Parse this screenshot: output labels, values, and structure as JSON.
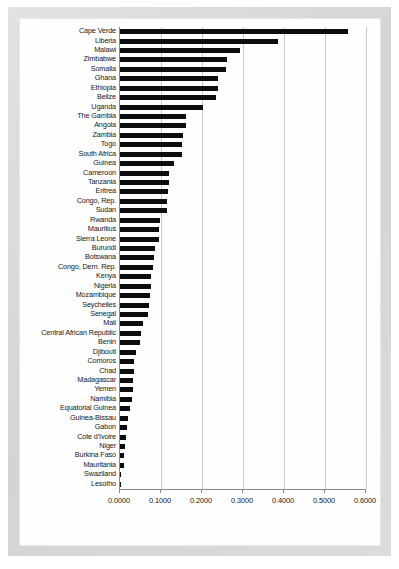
{
  "chart_data": {
    "type": "bar",
    "orientation": "horizontal",
    "title": "",
    "subtitle": "",
    "xlabel": "",
    "ylabel": "",
    "xlim": [
      0.0,
      0.6
    ],
    "ylim": null,
    "grid": true,
    "legend": null,
    "legend_position": "none",
    "bar_color": "#0d0d0d",
    "gridline_color": "#c9c9c9",
    "axis_color": "#8a8a8a",
    "xticks": [
      0.0,
      0.1,
      0.2,
      0.3,
      0.4,
      0.5,
      0.6
    ],
    "xtick_labels": [
      "0.0000",
      "0.1000",
      "0.2000",
      "0.3000",
      "0.4000",
      "0.5000",
      "0.6000"
    ],
    "categories": [
      "Cape Verde",
      "Liberia",
      "Malawi",
      "Zimbabwe",
      "Somalia",
      "Ghana",
      "Ethiopia",
      "Belize",
      "Uganda",
      "The Gambia",
      "Angola",
      "Zambia",
      "Togo",
      "South Africa",
      "Guinea",
      "Cameroon",
      "Tanzania",
      "Eritrea",
      "Congo, Rep.",
      "Sudan",
      "Rwanda",
      "Mauritius",
      "Sierra Leone",
      "Burundi",
      "Botswana",
      "Congo, Dem. Rep.",
      "Kenya",
      "Nigeria",
      "Mozambique",
      "Seychelles",
      "Senegal",
      "Mali",
      "Central African Republic",
      "Benin",
      "Djibouti",
      "Comoros",
      "Chad",
      "Madagascar",
      "Yemen",
      "Namibia",
      "Equatorial Guinea",
      "Guinea-Bissau",
      "Gabon",
      "Cote d'Ivoire",
      "Niger",
      "Burkina Faso",
      "Mauritania",
      "Swaziland",
      "Lesotho"
    ],
    "values": [
      0.557,
      0.385,
      0.293,
      0.262,
      0.258,
      0.24,
      0.238,
      0.235,
      0.202,
      0.162,
      0.16,
      0.154,
      0.151,
      0.15,
      0.132,
      0.12,
      0.119,
      0.118,
      0.115,
      0.114,
      0.098,
      0.096,
      0.095,
      0.085,
      0.084,
      0.081,
      0.076,
      0.075,
      0.074,
      0.07,
      0.069,
      0.057,
      0.05,
      0.049,
      0.04,
      0.035,
      0.034,
      0.032,
      0.031,
      0.03,
      0.025,
      0.02,
      0.016,
      0.014,
      0.011,
      0.01,
      0.009,
      0.002,
      0.001
    ]
  }
}
